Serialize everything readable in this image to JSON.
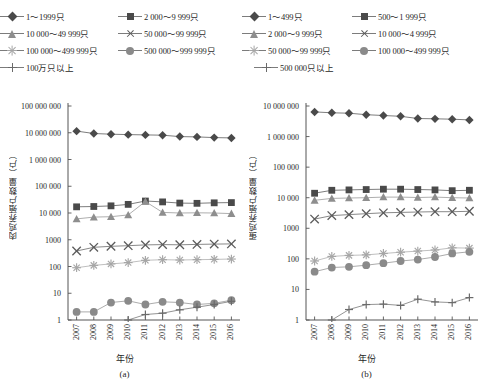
{
  "figure": {
    "background": "#ffffff",
    "x_label": "年份",
    "captions": {
      "a": "(a)",
      "b": "(b)"
    }
  },
  "panel_a": {
    "caption": "(a)",
    "y_label": "肉鸡养殖户数量（户）",
    "x_label": "年份",
    "y_ticks": [
      "100 000 000",
      "10 000 000",
      "1 000 000",
      "100 000",
      "10 000",
      "1000",
      "100",
      "10",
      "1"
    ],
    "x_ticks": [
      "2007",
      "2008",
      "2009",
      "2010",
      "2011",
      "2012",
      "2013",
      "2014",
      "2015",
      "2016"
    ],
    "legend": [
      {
        "label": "1～1999只",
        "marker": "diamond",
        "color": "#4a4a4a"
      },
      {
        "label": "2 000～9 999只",
        "marker": "square",
        "color": "#4a4a4a"
      },
      {
        "label": "10 000～49 999只",
        "marker": "triangle",
        "color": "#8e8e8e"
      },
      {
        "label": "50 000～99 999只",
        "marker": "cross",
        "color": "#5a5a5a"
      },
      {
        "label": "100 000～499 999只",
        "marker": "asterisk",
        "color": "#a6a6a6"
      },
      {
        "label": "500 000～999 999只",
        "marker": "circle",
        "color": "#8a8a8a"
      },
      {
        "label": "100万只以上",
        "marker": "plus",
        "color": "#6a6a6a"
      }
    ]
  },
  "panel_b": {
    "caption": "(b)",
    "y_label": "蛋鸡养殖户数量（户）",
    "x_label": "年份",
    "y_ticks": [
      "10 000 000",
      "1 000 000",
      "100 000",
      "10 000",
      "1000",
      "100",
      "10",
      "1"
    ],
    "x_ticks": [
      "2007",
      "2008",
      "2009",
      "2010",
      "2011",
      "2012",
      "2013",
      "2014",
      "2015",
      "2016"
    ],
    "legend": [
      {
        "label": "1～499只",
        "marker": "diamond",
        "color": "#4a4a4a"
      },
      {
        "label": "500～1 999只",
        "marker": "square",
        "color": "#4a4a4a"
      },
      {
        "label": "2 000～9 999只",
        "marker": "triangle",
        "color": "#8e8e8e"
      },
      {
        "label": "10 000～4 999只",
        "marker": "cross",
        "color": "#5a5a5a"
      },
      {
        "label": "50 000～99 999只",
        "marker": "asterisk",
        "color": "#a6a6a6"
      },
      {
        "label": "100 000～499 999只",
        "marker": "circle",
        "color": "#8a8a8a"
      },
      {
        "label": "500 000只以上",
        "marker": "plus",
        "color": "#6a6a6a"
      }
    ]
  },
  "chart_data": [
    {
      "type": "line",
      "panel": "(a)",
      "title": "肉鸡养殖户数量（户）",
      "xlabel": "年份",
      "ylabel": "肉鸡养殖户数量（户）",
      "yscale": "log",
      "ylim": [
        1,
        100000000
      ],
      "ytick_values": [
        1,
        10,
        100,
        1000,
        10000,
        100000,
        1000000,
        10000000,
        100000000
      ],
      "grid": false,
      "legend_position": "above",
      "x": [
        2007,
        2008,
        2009,
        2010,
        2011,
        2012,
        2013,
        2014,
        2015,
        2016
      ],
      "series": [
        {
          "name": "1～1999只",
          "marker": "diamond",
          "color": "#4a4a4a",
          "values": [
            11500000,
            9400000,
            8800000,
            8500000,
            8300000,
            8100000,
            7200000,
            7000000,
            6600000,
            6400000
          ]
        },
        {
          "name": "2 000～9 999只",
          "marker": "square",
          "color": "#4a4a4a",
          "values": [
            17000,
            17500,
            18500,
            21000,
            28000,
            26000,
            23500,
            23000,
            24000,
            24500
          ]
        },
        {
          "name": "10 000～49 999只",
          "marker": "triangle",
          "color": "#8e8e8e",
          "values": [
            6000,
            7000,
            7300,
            8500,
            27000,
            10500,
            10000,
            10200,
            10000,
            9500
          ]
        },
        {
          "name": "50 000～99 999只",
          "marker": "cross",
          "color": "#5a5a5a",
          "values": [
            380,
            520,
            570,
            600,
            640,
            660,
            650,
            670,
            690,
            700
          ]
        },
        {
          "name": "100 000～499 999只",
          "marker": "asterisk",
          "color": "#a6a6a6",
          "values": [
            90,
            110,
            125,
            140,
            170,
            180,
            175,
            180,
            185,
            190
          ]
        },
        {
          "name": "500 000～999 999只",
          "marker": "circle",
          "color": "#8a8a8a",
          "values": [
            2.0,
            2.0,
            4.5,
            5.2,
            3.8,
            4.8,
            4.5,
            3.8,
            4.2,
            5.5
          ]
        },
        {
          "name": "100万只以上",
          "marker": "plus",
          "color": "#6a6a6a",
          "values": [
            null,
            null,
            null,
            1.0,
            1.6,
            1.8,
            2.4,
            3.0,
            3.8,
            5.0
          ]
        }
      ]
    },
    {
      "type": "line",
      "panel": "(b)",
      "title": "蛋鸡养殖户数量（户）",
      "xlabel": "年份",
      "ylabel": "蛋鸡养殖户数量（户）",
      "yscale": "log",
      "ylim": [
        1,
        10000000
      ],
      "ytick_values": [
        1,
        10,
        100,
        1000,
        10000,
        100000,
        1000000,
        10000000
      ],
      "grid": false,
      "legend_position": "above",
      "x": [
        2007,
        2008,
        2009,
        2010,
        2011,
        2012,
        2013,
        2014,
        2015,
        2016
      ],
      "series": [
        {
          "name": "1～499只",
          "marker": "diamond",
          "color": "#4a4a4a",
          "values": [
            6400000,
            6000000,
            5800000,
            5200000,
            4900000,
            4600000,
            3900000,
            3800000,
            3700000,
            3500000
          ]
        },
        {
          "name": "500～1 999只",
          "marker": "square",
          "color": "#4a4a4a",
          "values": [
            14000,
            17500,
            18000,
            18500,
            19000,
            19000,
            18500,
            18000,
            17000,
            17500
          ]
        },
        {
          "name": "2 000～9 999只",
          "marker": "triangle",
          "color": "#8e8e8e",
          "values": [
            8200,
            9500,
            9800,
            10000,
            10500,
            10500,
            10200,
            10500,
            10000,
            9800
          ]
        },
        {
          "name": "10 000～4 999只",
          "marker": "cross",
          "color": "#5a5a5a",
          "values": [
            2000,
            2600,
            2800,
            3000,
            3200,
            3300,
            3400,
            3500,
            3500,
            3600
          ]
        },
        {
          "name": "50 000～99 999只",
          "marker": "asterisk",
          "color": "#a6a6a6",
          "values": [
            85,
            120,
            130,
            135,
            150,
            165,
            180,
            195,
            230,
            225
          ]
        },
        {
          "name": "100 000～499 999只",
          "marker": "circle",
          "color": "#8a8a8a",
          "values": [
            38,
            52,
            55,
            62,
            72,
            85,
            95,
            115,
            150,
            170
          ]
        },
        {
          "name": "500 000只以上",
          "marker": "plus",
          "color": "#6a6a6a",
          "values": [
            null,
            1.0,
            2.2,
            3.2,
            3.3,
            3.0,
            4.8,
            3.9,
            3.7,
            5.4
          ]
        }
      ]
    }
  ]
}
